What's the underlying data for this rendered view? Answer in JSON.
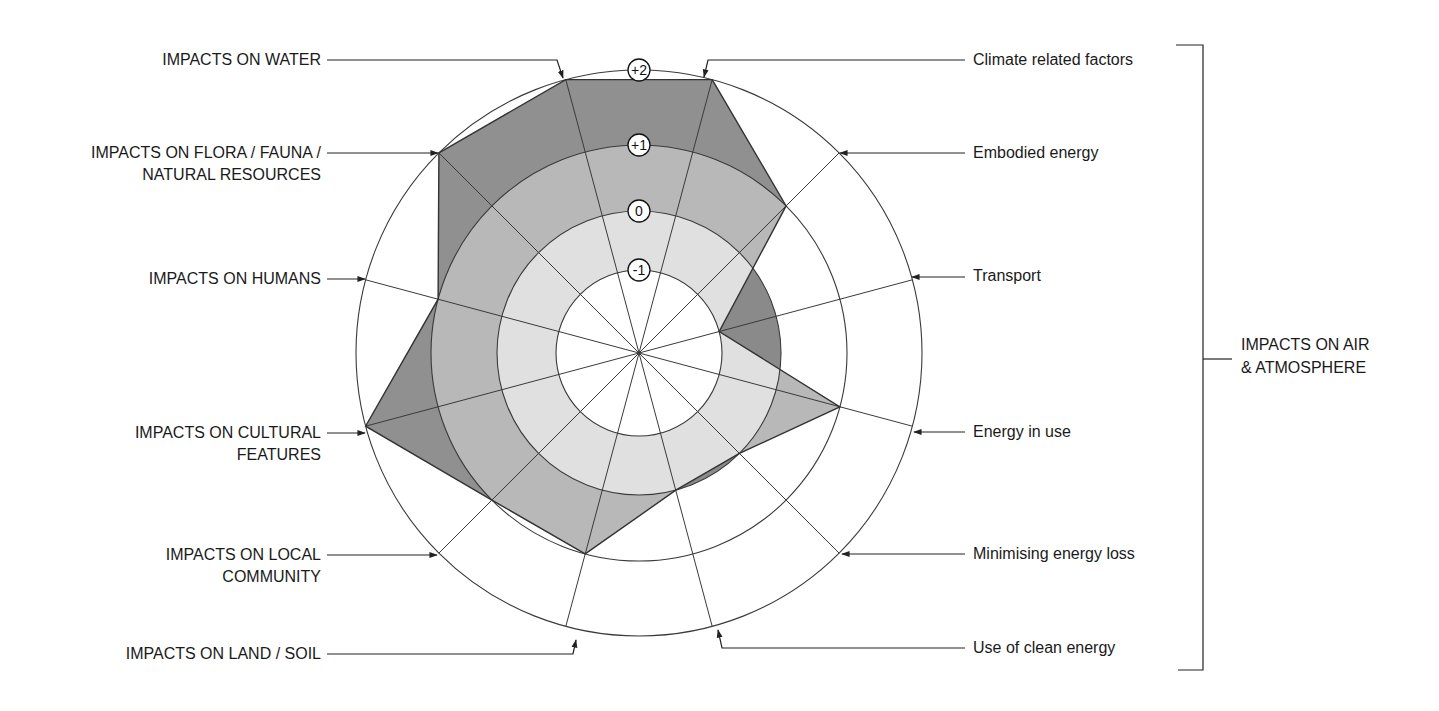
{
  "chart_data": {
    "type": "radar",
    "title": "",
    "center": [
      639,
      353
    ],
    "scale": {
      "ticks": [
        "-1",
        "0",
        "+1",
        "+2"
      ],
      "tick_values": [
        -1,
        0,
        1,
        2
      ],
      "tick_radii": [
        83,
        142,
        208,
        283
      ]
    },
    "axes": [
      {
        "label": "Climate related factors",
        "angle": 15,
        "value": 2,
        "side": "right",
        "group": "IMPACTS ON AIR & ATMOSPHERE"
      },
      {
        "label": "Embodied energy",
        "angle": 45,
        "value": 1,
        "side": "right",
        "group": "IMPACTS ON AIR & ATMOSPHERE"
      },
      {
        "label": "Transport",
        "angle": 75,
        "value": -1,
        "side": "right",
        "group": "IMPACTS ON AIR & ATMOSPHERE"
      },
      {
        "label": "Energy in use",
        "angle": 105,
        "value": 1,
        "side": "right",
        "group": "IMPACTS ON AIR & ATMOSPHERE"
      },
      {
        "label": "Minimising energy loss",
        "angle": 135,
        "value": 0,
        "side": "right",
        "group": "IMPACTS ON AIR & ATMOSPHERE"
      },
      {
        "label": "Use of clean energy",
        "angle": 165,
        "value": 0,
        "side": "right",
        "group": "IMPACTS ON AIR & ATMOSPHERE"
      },
      {
        "label": "IMPACTS ON LAND / SOIL",
        "angle": 195,
        "value": 1,
        "side": "left"
      },
      {
        "label": "IMPACTS ON LOCAL COMMUNITY",
        "angle": 225,
        "value": 1,
        "side": "left"
      },
      {
        "label": "IMPACTS ON CULTURAL FEATURES",
        "angle": 255,
        "value": 2,
        "side": "left"
      },
      {
        "label": "IMPACTS ON HUMANS",
        "angle": 285,
        "value": 1,
        "side": "left"
      },
      {
        "label": "IMPACTS ON FLORA / FAUNA / NATURAL RESOURCES",
        "angle": 315,
        "value": 2,
        "side": "left"
      },
      {
        "label": "IMPACTS ON WATER",
        "angle": 345,
        "value": 2,
        "side": "left"
      }
    ],
    "colors": {
      "band_low": "#e0e0e0",
      "band_mid": "#b8b8b8",
      "band_high": "#909090",
      "deficit": "#8a8a8a",
      "line": "#333333"
    },
    "legend": null,
    "grid": true
  },
  "labels": {
    "water": "IMPACTS ON WATER",
    "flora_line1": "IMPACTS ON FLORA / FAUNA /",
    "flora_line2": "NATURAL RESOURCES",
    "humans": "IMPACTS ON HUMANS",
    "cultural_line1": "IMPACTS ON CULTURAL",
    "cultural_line2": "FEATURES",
    "community_line1": "IMPACTS ON LOCAL",
    "community_line2": "COMMUNITY",
    "land": "IMPACTS ON LAND / SOIL",
    "climate": "Climate related factors",
    "embodied": "Embodied energy",
    "transport": "Transport",
    "energy_in_use": "Energy in use",
    "minimising": "Minimising energy loss",
    "clean": "Use of clean energy",
    "group_line1": "IMPACTS ON AIR",
    "group_line2": "& ATMOSPHERE"
  }
}
